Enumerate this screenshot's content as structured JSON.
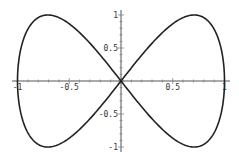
{
  "chart_data": {
    "type": "line",
    "title": "",
    "xlabel": "",
    "ylabel": "",
    "xlim": [
      -1,
      1
    ],
    "ylim": [
      -1,
      1
    ],
    "grid": false,
    "legend": null,
    "x_ticks": [
      "-1",
      "-0.5",
      "0.5",
      "1"
    ],
    "y_ticks": [
      "1",
      "0.5",
      "-0.5",
      "-1"
    ],
    "series": [
      {
        "name": "curve",
        "color": "#222222",
        "x": [
          0,
          0.383,
          0.707,
          0.924,
          1,
          0.924,
          0.707,
          0.383,
          0,
          -0.383,
          -0.707,
          -0.924,
          -1,
          -0.924,
          -0.707,
          -0.383,
          0
        ],
        "y": [
          0,
          0.707,
          1,
          0.707,
          0,
          -0.707,
          -1,
          -0.707,
          0,
          0.707,
          1,
          0.707,
          0,
          -0.707,
          -1,
          -0.707,
          0
        ]
      }
    ]
  }
}
